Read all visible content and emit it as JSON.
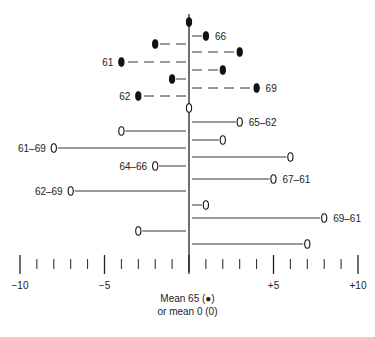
{
  "chart_data": {
    "type": "scatter",
    "title": "",
    "xlabel": "Mean 65 (●) or mean 0 (0)",
    "ylabel": "",
    "xlim": [
      -10,
      10
    ],
    "x_tick_labels": [
      "−10",
      "−5",
      "+5",
      "+10"
    ],
    "x_tick_values": [
      -10,
      -5,
      5,
      10
    ],
    "minor_ticks_every": 1,
    "grid": false,
    "series": [
      {
        "name": "Mean 65 (filled)",
        "marker": "filled",
        "line_style": "dashed",
        "points": [
          {
            "x": 0,
            "label": ""
          },
          {
            "x": 1,
            "label": "66"
          },
          {
            "x": -2,
            "label": ""
          },
          {
            "x": 3,
            "label": ""
          },
          {
            "x": -4,
            "label": "61"
          },
          {
            "x": 2,
            "label": ""
          },
          {
            "x": -1,
            "label": ""
          },
          {
            "x": 4,
            "label": "69"
          },
          {
            "x": -3,
            "label": "62"
          }
        ]
      },
      {
        "name": "Mean 0 (open)",
        "marker": "open",
        "line_style": "solid",
        "points": [
          {
            "x": 0,
            "label": ""
          },
          {
            "x": 3,
            "label": "65–62"
          },
          {
            "x": -4,
            "label": ""
          },
          {
            "x": 2,
            "label": ""
          },
          {
            "x": -8,
            "label": "61–69"
          },
          {
            "x": 6,
            "label": ""
          },
          {
            "x": -2,
            "label": "64–66"
          },
          {
            "x": 5,
            "label": "67–61"
          },
          {
            "x": -7,
            "label": "62–69"
          },
          {
            "x": 1,
            "label": ""
          },
          {
            "x": 8,
            "label": "69–61"
          },
          {
            "x": -3,
            "label": ""
          },
          {
            "x": 7,
            "label": ""
          }
        ]
      }
    ]
  },
  "caption": {
    "line1": "Mean 65 (●)",
    "line2": "or mean 0 (0)"
  }
}
